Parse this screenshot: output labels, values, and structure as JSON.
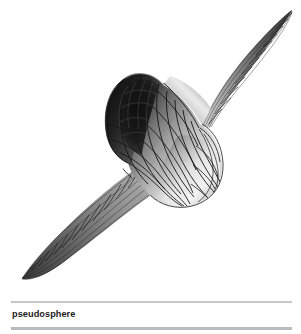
{
  "figure": {
    "name": "pseudosphere",
    "alt_description": "Grey shaded wireframe rendering of a pseudosphere (tractricoid) with two cusps and a bulging equator",
    "render_style": "shaded wireframe mesh",
    "orientation": "diagonal, cusps pointing upper-right and lower-left",
    "colors": {
      "background": "#ffffff",
      "mesh_line": "#1f1f1f",
      "highlight": "#f2f2f2",
      "midtone": "#9a9a9a",
      "shadow": "#2a2a2a",
      "deep_shadow": "#121212"
    },
    "mesh": {
      "meridian_count": 24,
      "parallel_count": 18
    }
  },
  "caption": {
    "label": "pseudosphere"
  },
  "rules": {
    "top_color": "#c6c7cb",
    "bottom_color": "#b9bbbf"
  }
}
